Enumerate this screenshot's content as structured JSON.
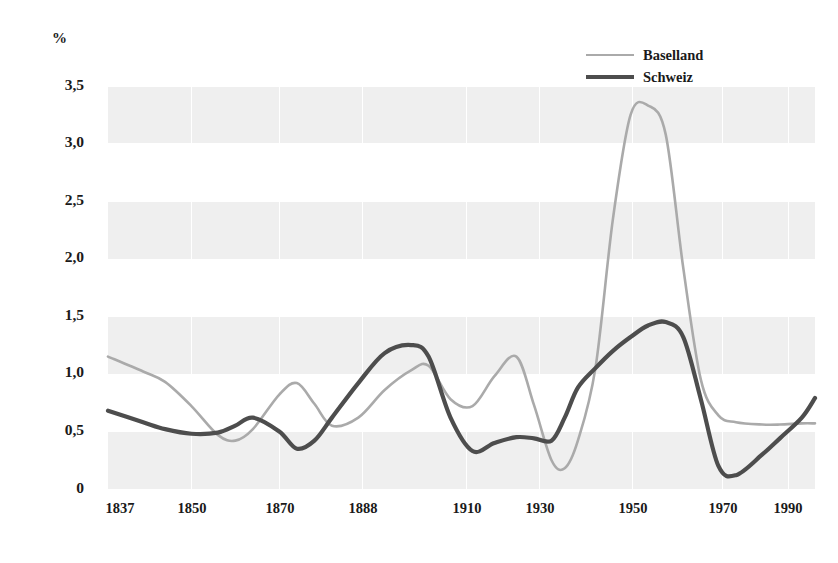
{
  "axis": {
    "y_unit": "%",
    "y_ticks": [
      "3,5",
      "3,0",
      "2,5",
      "2,0",
      "1,5",
      "1,0",
      "0,5",
      "0"
    ],
    "x_ticks": [
      "1837",
      "1850",
      "1870",
      "1888",
      "1910",
      "1930",
      "1950",
      "1970",
      "1990"
    ]
  },
  "legend": {
    "items": [
      {
        "label": "Baselland",
        "color": "#aaaaaa"
      },
      {
        "label": "Schweiz",
        "color": "#4d4d4d"
      }
    ]
  },
  "chart_data": {
    "type": "line",
    "title": "",
    "subtitle": "",
    "xlabel": "",
    "ylabel": "%",
    "ylim": [
      0,
      3.5
    ],
    "xlim": [
      1837,
      1998
    ],
    "grid": "horizontal-bands",
    "legend_position": "top-right",
    "y_tick_values": [
      0,
      0.5,
      1.0,
      1.5,
      2.0,
      2.5,
      3.0,
      3.5
    ],
    "x_tick_values": [
      1837,
      1850,
      1870,
      1888,
      1910,
      1930,
      1950,
      1970,
      1990
    ],
    "annotations": [],
    "series": [
      {
        "name": "Baselland",
        "color": "#aaaaaa",
        "x": [
          1837,
          1845,
          1850,
          1856,
          1862,
          1866,
          1870,
          1876,
          1880,
          1884,
          1888,
          1894,
          1900,
          1906,
          1910,
          1915,
          1920,
          1925,
          1930,
          1934,
          1938,
          1941,
          1944,
          1948,
          1952,
          1956,
          1960,
          1964,
          1968,
          1972,
          1976,
          1980,
          1986,
          1990,
          1995,
          1998
        ],
        "values": [
          1.15,
          1.02,
          0.93,
          0.72,
          0.47,
          0.42,
          0.52,
          0.82,
          0.92,
          0.74,
          0.55,
          0.62,
          0.86,
          1.03,
          1.07,
          0.78,
          0.72,
          0.98,
          1.15,
          0.73,
          0.25,
          0.18,
          0.42,
          1.05,
          2.35,
          3.25,
          3.33,
          3.08,
          1.92,
          0.95,
          0.64,
          0.58,
          0.56,
          0.56,
          0.57,
          0.57
        ]
      },
      {
        "name": "Schweiz",
        "color": "#4d4d4d",
        "x": [
          1837,
          1845,
          1850,
          1856,
          1862,
          1866,
          1870,
          1876,
          1880,
          1884,
          1888,
          1894,
          1900,
          1906,
          1910,
          1915,
          1920,
          1925,
          1930,
          1934,
          1938,
          1941,
          1944,
          1948,
          1952,
          1956,
          1960,
          1964,
          1968,
          1972,
          1976,
          1980,
          1986,
          1990,
          1995,
          1998
        ],
        "values": [
          0.68,
          0.58,
          0.52,
          0.48,
          0.49,
          0.55,
          0.62,
          0.5,
          0.35,
          0.42,
          0.62,
          0.92,
          1.18,
          1.25,
          1.15,
          0.62,
          0.33,
          0.4,
          0.45,
          0.44,
          0.42,
          0.62,
          0.88,
          1.05,
          1.2,
          1.32,
          1.42,
          1.45,
          1.32,
          0.78,
          0.2,
          0.12,
          0.3,
          0.44,
          0.62,
          0.79
        ]
      }
    ]
  }
}
